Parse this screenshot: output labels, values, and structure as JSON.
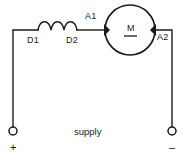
{
  "diagram": {
    "labels": {
      "field_start": "D1",
      "field_end": "D2",
      "armature_start": "A1",
      "armature_end": "A2",
      "motor_symbol": "M",
      "supply": "supply",
      "positive_terminal": "+",
      "negative_terminal": "–"
    },
    "colors": {
      "line": "#1a1a1a",
      "background": "#ffffff"
    },
    "components": [
      {
        "name": "field-winding",
        "type": "inductor",
        "terminals": [
          "D1",
          "D2"
        ],
        "humps": 3
      },
      {
        "name": "motor",
        "type": "dc-motor",
        "symbol": "M",
        "terminals": [
          "A1",
          "A2"
        ]
      },
      {
        "name": "supply-terminal-positive",
        "type": "terminal",
        "polarity": "+"
      },
      {
        "name": "supply-terminal-negative",
        "type": "terminal",
        "polarity": "–"
      }
    ]
  }
}
